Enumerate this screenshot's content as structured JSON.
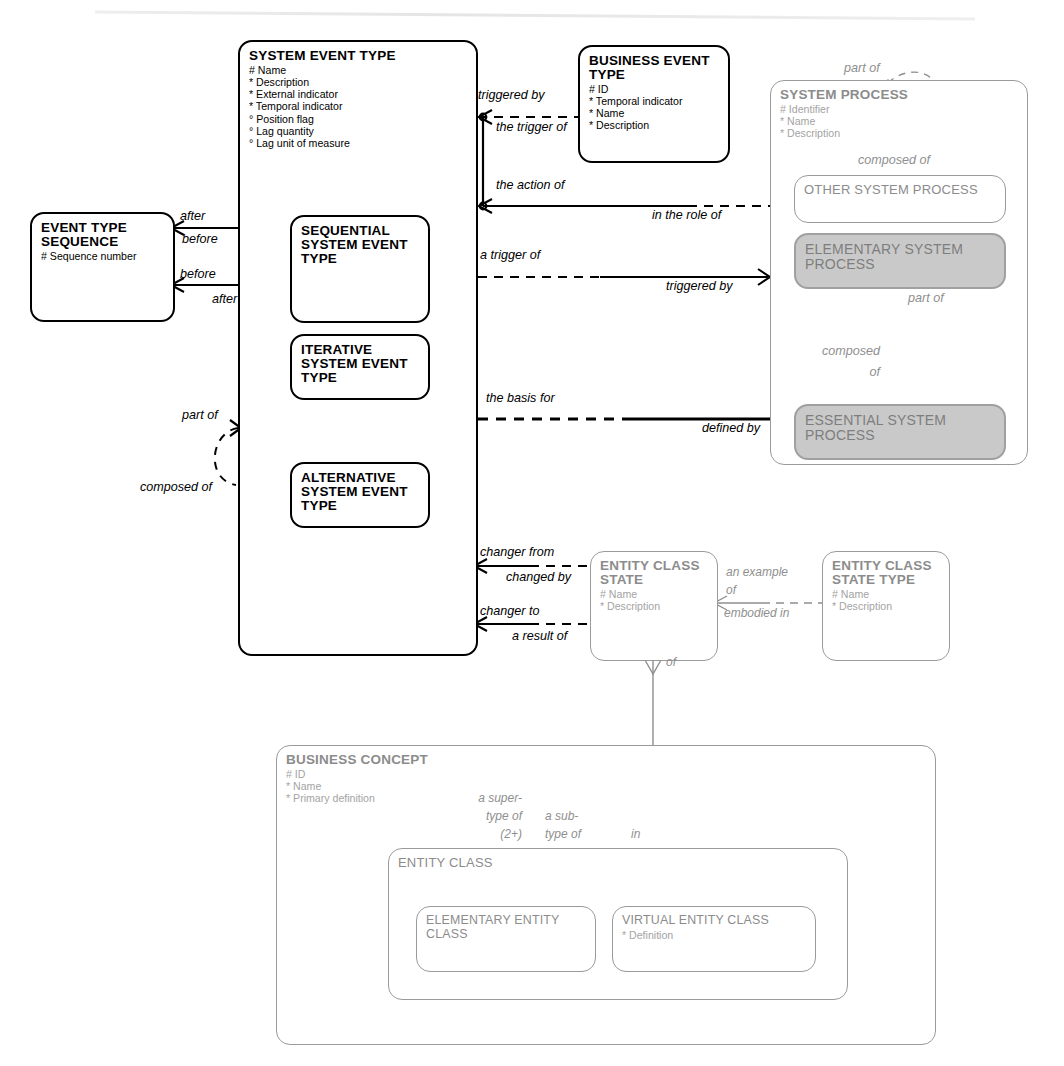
{
  "diagram": {
    "notation": "Barker ERD",
    "caption": ""
  },
  "entities": {
    "system_event_type": {
      "name": "SYSTEM EVENT TYPE",
      "attributes": [
        "# Name",
        "* Description",
        "* External indicator",
        "* Temporal indicator",
        "° Position flag",
        "° Lag quantity",
        "° Lag unit of measure"
      ]
    },
    "business_event_type": {
      "name": "BUSINESS EVENT TYPE",
      "attributes": [
        "# ID",
        "* Temporal indicator",
        "* Name",
        "* Description"
      ]
    },
    "event_type_sequence": {
      "name": "EVENT TYPE SEQUENCE",
      "attributes": [
        "# Sequence number"
      ]
    },
    "sequential_system_event_type": {
      "name": "SEQUENTIAL SYSTEM EVENT TYPE",
      "attributes": []
    },
    "iterative_system_event_type": {
      "name": "ITERATIVE SYSTEM EVENT TYPE",
      "attributes": []
    },
    "alternative_system_event_type": {
      "name": "ALTERNATIVE SYSTEM EVENT TYPE",
      "attributes": []
    },
    "system_process": {
      "name": "SYSTEM PROCESS",
      "attributes": [
        "# Identifier",
        "* Name",
        "* Description"
      ]
    },
    "other_system_process": {
      "name": "OTHER SYSTEM PROCESS",
      "attributes": []
    },
    "elementary_system_process": {
      "name": "ELEMENTARY SYSTEM PROCESS",
      "attributes": []
    },
    "essential_system_process": {
      "name": "ESSENTIAL SYSTEM PROCESS",
      "attributes": []
    },
    "entity_class_state": {
      "name": "ENTITY CLASS STATE",
      "attributes": [
        "# Name",
        "* Description"
      ]
    },
    "entity_class_state_type": {
      "name": "ENTITY CLASS STATE TYPE",
      "attributes": [
        "# Name",
        "* Description"
      ]
    },
    "business_concept": {
      "name": "BUSINESS CONCEPT",
      "attributes": [
        "# ID",
        "* Name",
        "* Primary definition"
      ]
    },
    "entity_class": {
      "name": "ENTITY CLASS",
      "attributes": []
    },
    "elementary_entity_class": {
      "name": "ELEMENTARY ENTITY CLASS",
      "attributes": []
    },
    "virtual_entity_class": {
      "name": "VIRTUAL ENTITY CLASS",
      "attributes": [
        "* Definition"
      ]
    }
  },
  "relationship_labels": {
    "triggered_by": "triggered by",
    "the_trigger_of": "the trigger of",
    "the_action_of": "the action of",
    "in_the_role_of": "in the role of",
    "a_trigger_of": "a trigger of",
    "triggered_by_2": "triggered by",
    "the_basis_for": "the basis for",
    "defined_by": "defined by",
    "after_top": "after",
    "before_top": "before",
    "before_bottom": "before",
    "after_bottom": "after",
    "part_of_left": "part of",
    "composed_of_left": "composed of",
    "part_of_sp": "part of",
    "composed_of_sp": "composed of",
    "part_of_esp": "part of",
    "composed_line1": "composed",
    "composed_line2": "of",
    "changer_from": "changer from",
    "changed_by": "changed by",
    "changer_to": "changer to",
    "a_result_of": "a result of",
    "an_example_of_1": "an example",
    "an_example_of_2": "of",
    "embodied_in": "embodied in",
    "of_vertical": "of",
    "a_super_type_of_1": "a super-",
    "a_super_type_of_2": "type of",
    "a_super_type_of_3": "(2+)",
    "a_sub_type_of_1": "a sub-",
    "a_sub_type_of_2": "type of",
    "in_label": "in"
  },
  "colors": {
    "line_black": "#000000",
    "line_gray": "#8f8f8f",
    "fill_gray": "#c9c9c9",
    "text_gray": "#8c8c8c",
    "background": "#ffffff"
  }
}
